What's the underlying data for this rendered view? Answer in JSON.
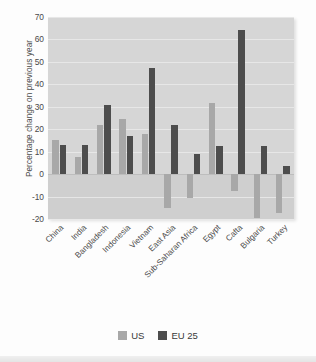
{
  "chart_data": {
    "type": "bar",
    "title": "",
    "xlabel": "",
    "ylabel": "Percentage change on previous year",
    "ylim": [
      -20,
      70
    ],
    "yticks": [
      70,
      60,
      50,
      40,
      30,
      20,
      10,
      0,
      -10,
      -20
    ],
    "ytick_labels": [
      "70",
      "60",
      "50",
      "40",
      "30",
      "20",
      "10",
      "0",
      "-10",
      "-20"
    ],
    "grid": true,
    "legend_position": "bottom",
    "categories": [
      "China",
      "India",
      "Bangladesh",
      "Indonesia",
      "Vietnam",
      "East Asia",
      "Sub-Saharan Africa",
      "Egypt",
      "Cafta",
      "Bulgaria",
      "Turkey"
    ],
    "series": [
      {
        "name": "US",
        "color": "#a8a8a8",
        "values": [
          15,
          7.5,
          22,
          24.5,
          18,
          -15,
          -10.5,
          31.5,
          -7.5,
          -19.5,
          -17.5
        ]
      },
      {
        "name": "EU 25",
        "color": "#4d4d4d",
        "values": [
          13,
          13,
          31,
          17,
          47.5,
          22,
          9,
          12.5,
          64,
          12.5,
          3.5
        ]
      }
    ]
  },
  "legend": {
    "items": [
      {
        "label": "US",
        "color": "#a8a8a8"
      },
      {
        "label": "EU 25",
        "color": "#4d4d4d"
      }
    ]
  },
  "colors": {
    "plot_background": "#d6d6d6",
    "negative_shade": "#cfcfcf",
    "gridline": "#eaeaea",
    "zero_line": "#bdbdbd",
    "text": "#4a4a4a",
    "page_background": "#fdfdfd"
  }
}
